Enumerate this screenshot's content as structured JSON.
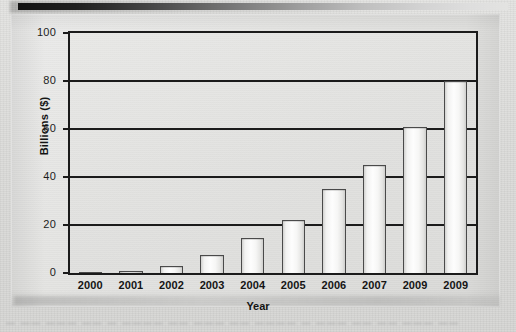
{
  "chart_data": {
    "type": "bar",
    "title": "",
    "xlabel": "Year",
    "ylabel": "Billions ($)",
    "categories": [
      "2000",
      "2001",
      "2002",
      "2003",
      "2004",
      "2005",
      "2006",
      "2007",
      "2009",
      "2009"
    ],
    "values": [
      0.3,
      1,
      3,
      7.5,
      14.5,
      22,
      35,
      45,
      61,
      80
    ],
    "ylim": [
      0,
      100
    ],
    "yticks": [
      "0",
      "20",
      "40",
      "60",
      "80",
      "100"
    ],
    "ytick_values": [
      0,
      20,
      40,
      60,
      80,
      100
    ],
    "grid": "horizontal",
    "legend": "none",
    "bar_fill": "#fdfdfd",
    "bar_outline": "#4a4a4a",
    "axis_color": "#1b1b1b",
    "panel_background": "#e5e5e3"
  },
  "artifacts": {
    "caption_text": "—  ——   ———   ——  —  ————  ——  ———  ——  ————  —  ———  ——  ——  ———  ——"
  }
}
